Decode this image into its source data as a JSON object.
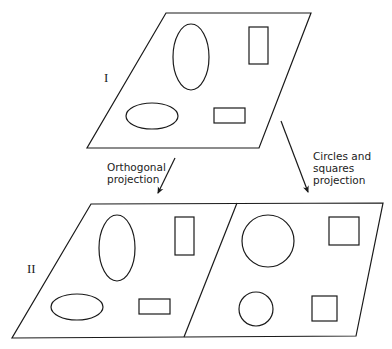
{
  "diagram": {
    "panel_top": {
      "label": "I",
      "shapes": [
        "vertical-ellipse",
        "vertical-rectangle",
        "horizontal-ellipse",
        "horizontal-rectangle"
      ]
    },
    "panel_bottom": {
      "label": "II",
      "left_half": {
        "shapes": [
          "vertical-ellipse",
          "vertical-rectangle",
          "horizontal-ellipse",
          "horizontal-rectangle"
        ]
      },
      "right_half": {
        "shapes": [
          "large-circle",
          "large-square",
          "small-circle",
          "small-square"
        ]
      }
    },
    "arrows": {
      "left": {
        "line1": "Orthogonal",
        "line2": "projection"
      },
      "right": {
        "line1": "Circles and",
        "line2": "squares",
        "line3": "projection"
      }
    },
    "colors": {
      "stroke": "#1a1a1a",
      "background": "#ffffff"
    }
  }
}
